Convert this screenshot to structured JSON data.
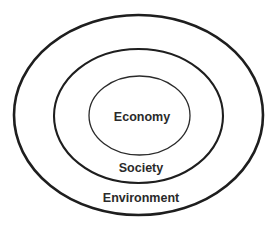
{
  "diagram": {
    "type": "nested-ellipses",
    "stroke_color": "#1e1e1e",
    "text_color": "#2a2a2a",
    "background": "#ffffff",
    "layers": [
      {
        "name": "Environment",
        "label": "Environment",
        "level": "outer",
        "contains": "Society"
      },
      {
        "name": "Society",
        "label": "Society",
        "level": "middle",
        "contains": "Economy"
      },
      {
        "name": "Economy",
        "label": "Economy",
        "level": "inner",
        "contains": null
      }
    ]
  }
}
